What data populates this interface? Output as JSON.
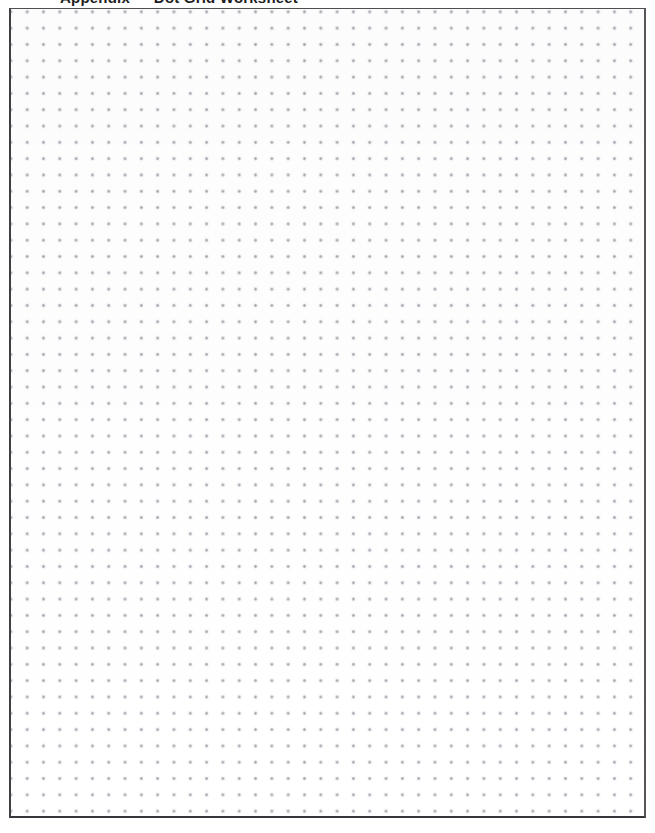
{
  "document": {
    "type": "dot-grid-paper",
    "header_text": "Appendix — Dot Grid Worksheet",
    "header_visible_fragment": "descenders only (text cropped at top edge)",
    "page_width_px": 655,
    "page_height_px": 833,
    "background_color": "#ffffff"
  },
  "sheet": {
    "label": "dot grid sheet",
    "border_color_top": "#4d4d52",
    "border_color_left": "#3f3f44",
    "border_color_right": "#55555a",
    "border_color_bottom": "#37373b",
    "left_px": 9,
    "top_px": 8,
    "width_px": 637,
    "height_px": 810,
    "fill_color": "#ffffff"
  },
  "grid": {
    "label": "dot lattice",
    "dot_color": "#9b9ba6",
    "halo_color": "#c4c4ce",
    "spacing_px": 16.32,
    "dot_diameter_px": 1.7,
    "columns": 39,
    "rows": 49,
    "offset_x_px": 8,
    "offset_y_px": 11
  }
}
